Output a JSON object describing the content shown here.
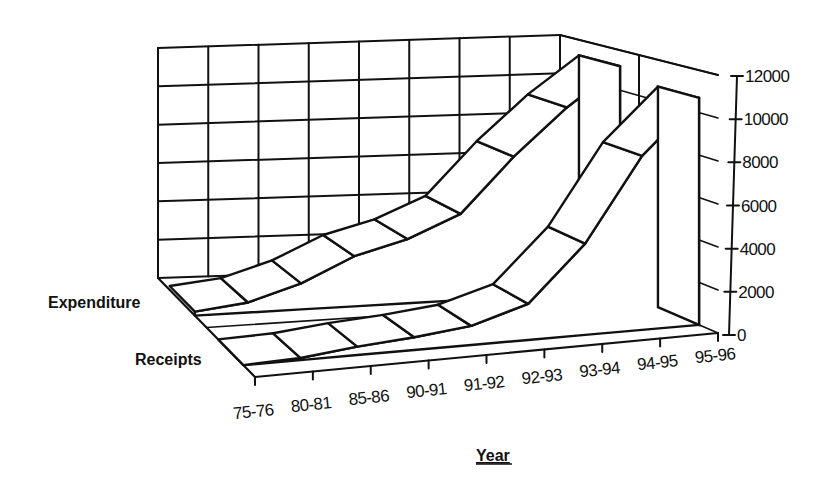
{
  "chart_data": {
    "type": "area",
    "subtype": "3d-ribbon",
    "title": "",
    "xlabel": "Year",
    "ylabel": "",
    "categories": [
      "75-76",
      "80-81",
      "85-86",
      "90-91",
      "91-92",
      "92-93",
      "93-94",
      "94-95",
      "95-96"
    ],
    "series": [
      {
        "name": "Expenditure",
        "values": [
          200,
          500,
          1300,
          2500,
          3200,
          4300,
          7000,
          9300,
          11200
        ]
      },
      {
        "name": "Receipts",
        "values": [
          0,
          100,
          400,
          600,
          900,
          1700,
          4300,
          8200,
          10700
        ]
      }
    ],
    "y_ticks": [
      "0",
      "2000",
      "4000",
      "6000",
      "8000",
      "10000",
      "12000"
    ],
    "ylim": [
      0,
      12000
    ],
    "grid": true,
    "legend_position": "series labels on depth axis (left)",
    "colors": {
      "line": "#111111",
      "fill": "#ffffff",
      "background": "#ffffff"
    }
  }
}
